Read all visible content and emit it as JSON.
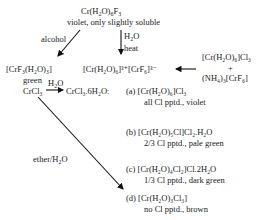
{
  "top": {
    "formula": [
      "Cr(H",
      "2",
      "O)",
      "6",
      "F",
      "3"
    ],
    "desc": "violet, only slightly soluble"
  },
  "labels": {
    "alcohol": "alcohol",
    "h2o_heat_1": "H",
    "h2o_heat_2": "2",
    "h2o_heat_3": "O",
    "heat": "heat",
    "ether": "ether/H",
    "ether_sub": "2",
    "ether_end": "O",
    "h2o_top": "H",
    "h2o_top_sub": "2",
    "h2o_top_end": "O"
  },
  "left_product": {
    "formula": "[CrF₃(H₂O)₃]",
    "color": "green"
  },
  "middle_product": {
    "formula": "[Cr(H₂O)₆]³⁺[CrF₆]³⁻"
  },
  "right_reactants": {
    "line1": "[Cr(H₂O)₆]Cl₃",
    "plus": "+",
    "line2": "(NH₄)₃[CrF₆]"
  },
  "crcl3": {
    "reactant": "CrCl₃",
    "product": "CrCl₃.6H₂O:"
  },
  "isomers": [
    {
      "label": "(a)",
      "formula": "[Cr(H₂O)₆]Cl₃",
      "note": "all Cl pptd., violet"
    },
    {
      "label": "(b)",
      "formula": "[Cr(H₂O)₅Cl]Cl₂.H₂O",
      "note": "2/3 Cl pptd., pale green"
    },
    {
      "label": "(c)",
      "formula": "[Cr(H₂O)₄Cl₂]Cl.2H₂O",
      "note": "1/3 Cl pptd., dark green"
    },
    {
      "label": "(d)",
      "formula": "[Cr(H₂O)₃Cl₃]",
      "note": "no Cl pptd., brown"
    }
  ]
}
